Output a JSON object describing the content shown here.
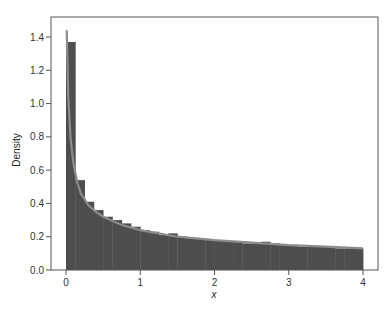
{
  "chart_data": {
    "type": "bar",
    "subtype": "histogram-with-density-curve",
    "title": "",
    "xlabel": "x",
    "ylabel": "Density",
    "xlim": [
      0,
      4
    ],
    "ylim": [
      0,
      1.4
    ],
    "x_ticks": [
      0,
      1,
      2,
      3,
      4
    ],
    "x_tick_labels": [
      "0",
      "1",
      "2",
      "3",
      "4"
    ],
    "y_ticks": [
      0.0,
      0.2,
      0.4,
      0.6,
      0.8,
      1.0,
      1.2,
      1.4
    ],
    "y_tick_labels": [
      "0.0",
      "0.2",
      "0.4",
      "0.6",
      "0.8",
      "1.0",
      "1.2",
      "1.4"
    ],
    "grid": false,
    "legend": null,
    "bin_width": 0.125,
    "bin_edges_start": [
      0,
      0.125,
      0.25,
      0.375,
      0.5,
      0.625,
      0.75,
      0.875,
      1.0,
      1.125,
      1.25,
      1.375,
      1.5,
      1.625,
      1.75,
      1.875,
      2.0,
      2.125,
      2.25,
      2.375,
      2.5,
      2.625,
      2.75,
      2.875,
      3.0,
      3.125,
      3.25,
      3.375,
      3.5,
      3.625,
      3.75,
      3.875
    ],
    "values": [
      1.37,
      0.54,
      0.41,
      0.36,
      0.32,
      0.3,
      0.28,
      0.26,
      0.24,
      0.23,
      0.21,
      0.22,
      0.2,
      0.19,
      0.19,
      0.18,
      0.18,
      0.17,
      0.17,
      0.16,
      0.16,
      0.17,
      0.16,
      0.15,
      0.15,
      0.14,
      0.14,
      0.14,
      0.14,
      0.13,
      0.13,
      0.13
    ],
    "series": [
      {
        "name": "histogram",
        "type": "bar",
        "color": "#4d4d4d"
      },
      {
        "name": "density curve",
        "type": "line",
        "color": "#8c8c8c",
        "x": [
          0.01,
          0.03,
          0.06,
          0.1,
          0.15,
          0.2,
          0.3,
          0.4,
          0.5,
          0.75,
          1.0,
          1.5,
          2.0,
          2.5,
          3.0,
          3.5,
          4.0
        ],
        "y": [
          1.44,
          1.05,
          0.8,
          0.64,
          0.53,
          0.46,
          0.39,
          0.35,
          0.32,
          0.27,
          0.24,
          0.2,
          0.18,
          0.165,
          0.15,
          0.14,
          0.13
        ]
      }
    ]
  },
  "colors": {
    "bar_fill": "#4d4d4d",
    "curve": "#8c8c8c",
    "axis": "#555555",
    "background": "#ffffff"
  }
}
